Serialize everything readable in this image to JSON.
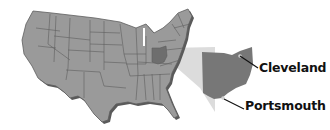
{
  "map": {
    "title": "United States map with Ohio highlighted",
    "region_highlighted": "Ohio",
    "colors": {
      "states_fill": "#9a9a9a",
      "state_borders": "#5e5e5e",
      "highlight_fill": "#6e6e6e",
      "wedge_fill": "#dcdcdc",
      "shadow": "#5a5a5a",
      "label_text": "#111111",
      "leader_line": "#111111",
      "city_dot": "#cfcfcf"
    },
    "labels": [
      {
        "name": "Cleveland"
      },
      {
        "name": "Portsmouth"
      }
    ]
  }
}
